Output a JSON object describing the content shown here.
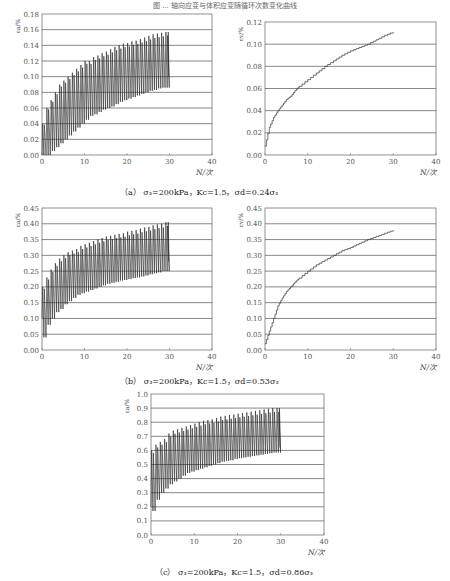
{
  "page": {
    "title": "图 ... 轴向应变与体积应变随循环次数变化曲线"
  },
  "captions": {
    "a": "（a） σ₃=200kPa，Kc=1.5，σd=0.24σ₃",
    "b": "（b） σ₃=200kPa，Kc=1.5，σd=0.53σ₃",
    "c": "（c） σ₃=200kPa，Kc=1.5，σd=0.86σ₃"
  },
  "chart_data": [
    {
      "id": "a-left",
      "type": "line",
      "title": "",
      "xlabel": "N/次",
      "ylabel": "εa/%",
      "xlim": [
        0,
        40
      ],
      "ylim": [
        0,
        0.18
      ],
      "xticks": [
        "0",
        "10",
        "20",
        "30",
        "40"
      ],
      "yticks": [
        "0.00",
        "0.02",
        "0.04",
        "0.06",
        "0.08",
        "0.10",
        "0.12",
        "0.14",
        "0.16",
        "0.18"
      ],
      "grid": "horizontal",
      "description": "cyclic axial strain oscillating between envelope min and max",
      "x": [
        0,
        1,
        2,
        3,
        4,
        5,
        6,
        7,
        8,
        9,
        10,
        11,
        12,
        13,
        14,
        15,
        16,
        17,
        18,
        19,
        20,
        21,
        22,
        23,
        24,
        25,
        26,
        27,
        28,
        29
      ],
      "series": [
        {
          "name": "peak",
          "values": [
            0.04,
            0.06,
            0.07,
            0.08,
            0.09,
            0.095,
            0.1,
            0.105,
            0.11,
            0.115,
            0.12,
            0.12,
            0.125,
            0.127,
            0.13,
            0.132,
            0.135,
            0.138,
            0.14,
            0.142,
            0.143,
            0.145,
            0.146,
            0.148,
            0.15,
            0.152,
            0.154,
            0.155,
            0.156,
            0.157
          ]
        },
        {
          "name": "trough",
          "values": [
            0.0,
            0.0,
            0.0,
            0.005,
            0.01,
            0.015,
            0.02,
            0.025,
            0.03,
            0.035,
            0.04,
            0.045,
            0.05,
            0.052,
            0.055,
            0.058,
            0.06,
            0.062,
            0.065,
            0.068,
            0.07,
            0.072,
            0.074,
            0.076,
            0.078,
            0.08,
            0.082,
            0.083,
            0.085,
            0.086
          ]
        }
      ],
      "end_value": 0.1
    },
    {
      "id": "a-right",
      "type": "line",
      "title": "",
      "xlabel": "N/次",
      "ylabel": "εv/%",
      "xlim": [
        0,
        40
      ],
      "ylim": [
        0,
        0.12
      ],
      "xticks": [
        "0",
        "10",
        "20",
        "30",
        "40"
      ],
      "yticks": [
        "0.00",
        "0.02",
        "0.04",
        "0.06",
        "0.08",
        "0.10",
        "0.12"
      ],
      "grid": "horizontal",
      "x": [
        0,
        1,
        2,
        3,
        4,
        5,
        6,
        7,
        8,
        10,
        12,
        14,
        16,
        18,
        20,
        22,
        24,
        26,
        28,
        30
      ],
      "values": [
        0.008,
        0.025,
        0.034,
        0.04,
        0.045,
        0.05,
        0.053,
        0.058,
        0.062,
        0.068,
        0.074,
        0.08,
        0.085,
        0.09,
        0.094,
        0.097,
        0.1,
        0.104,
        0.108,
        0.111
      ]
    },
    {
      "id": "b-left",
      "type": "line",
      "title": "",
      "xlabel": "N/次",
      "ylabel": "εa/%",
      "xlim": [
        0,
        40
      ],
      "ylim": [
        0,
        0.45
      ],
      "xticks": [
        "0",
        "10",
        "20",
        "30",
        "40"
      ],
      "yticks": [
        "0.00",
        "0.05",
        "0.10",
        "0.15",
        "0.20",
        "0.25",
        "0.30",
        "0.35",
        "0.40",
        "0.45"
      ],
      "grid": "horizontal",
      "description": "cyclic axial strain oscillating between envelope min and max",
      "x": [
        0,
        1,
        2,
        3,
        4,
        5,
        6,
        7,
        8,
        9,
        10,
        11,
        12,
        13,
        14,
        15,
        16,
        17,
        18,
        19,
        20,
        21,
        22,
        23,
        24,
        25,
        26,
        27,
        28,
        29
      ],
      "series": [
        {
          "name": "peak",
          "values": [
            0.2,
            0.23,
            0.255,
            0.275,
            0.29,
            0.3,
            0.31,
            0.315,
            0.32,
            0.33,
            0.335,
            0.34,
            0.345,
            0.35,
            0.355,
            0.36,
            0.362,
            0.365,
            0.368,
            0.37,
            0.375,
            0.378,
            0.38,
            0.385,
            0.388,
            0.39,
            0.395,
            0.398,
            0.4,
            0.405
          ]
        },
        {
          "name": "trough",
          "values": [
            0.1,
            0.04,
            0.08,
            0.1,
            0.12,
            0.13,
            0.145,
            0.155,
            0.165,
            0.175,
            0.18,
            0.185,
            0.19,
            0.195,
            0.2,
            0.205,
            0.21,
            0.213,
            0.216,
            0.22,
            0.222,
            0.225,
            0.228,
            0.23,
            0.233,
            0.236,
            0.24,
            0.243,
            0.246,
            0.25
          ]
        }
      ],
      "end_value": 0.28
    },
    {
      "id": "b-right",
      "type": "line",
      "title": "",
      "xlabel": "N/次",
      "ylabel": "εv/%",
      "xlim": [
        0,
        40
      ],
      "ylim": [
        0,
        0.45
      ],
      "xticks": [
        "0",
        "10",
        "20",
        "30",
        "40"
      ],
      "yticks": [
        "0.00",
        "0.05",
        "0.10",
        "0.15",
        "0.20",
        "0.25",
        "0.30",
        "0.35",
        "0.40",
        "0.45"
      ],
      "grid": "horizontal",
      "x": [
        0,
        1,
        2,
        3,
        4,
        5,
        6,
        7,
        8,
        10,
        12,
        14,
        16,
        18,
        20,
        22,
        24,
        26,
        28,
        30
      ],
      "values": [
        0.02,
        0.06,
        0.1,
        0.14,
        0.165,
        0.185,
        0.2,
        0.215,
        0.228,
        0.25,
        0.27,
        0.285,
        0.3,
        0.315,
        0.325,
        0.338,
        0.35,
        0.36,
        0.37,
        0.38
      ]
    },
    {
      "id": "c",
      "type": "line",
      "title": "",
      "xlabel": "N/次",
      "ylabel": "εa/%",
      "xlim": [
        0,
        40
      ],
      "ylim": [
        0,
        1.0
      ],
      "xticks": [
        "0",
        "10",
        "20",
        "30",
        "40"
      ],
      "yticks": [
        "0.0",
        "0.1",
        "0.2",
        "0.3",
        "0.4",
        "0.5",
        "0.6",
        "0.7",
        "0.8",
        "0.9",
        "1.0"
      ],
      "grid": "horizontal",
      "description": "cyclic axial strain oscillating between envelope min and max",
      "x": [
        0,
        1,
        2,
        3,
        4,
        5,
        6,
        7,
        8,
        9,
        10,
        11,
        12,
        13,
        14,
        15,
        16,
        17,
        18,
        19,
        20,
        21,
        22,
        23,
        24,
        25,
        26,
        27,
        28,
        29
      ],
      "series": [
        {
          "name": "peak",
          "values": [
            0.6,
            0.64,
            0.66,
            0.68,
            0.72,
            0.74,
            0.75,
            0.76,
            0.77,
            0.78,
            0.79,
            0.8,
            0.81,
            0.815,
            0.82,
            0.83,
            0.84,
            0.845,
            0.85,
            0.855,
            0.86,
            0.865,
            0.87,
            0.875,
            0.88,
            0.885,
            0.89,
            0.895,
            0.9,
            0.9
          ]
        },
        {
          "name": "trough",
          "values": [
            0.2,
            0.17,
            0.25,
            0.3,
            0.33,
            0.36,
            0.38,
            0.4,
            0.42,
            0.44,
            0.45,
            0.46,
            0.47,
            0.48,
            0.49,
            0.5,
            0.51,
            0.52,
            0.525,
            0.53,
            0.54,
            0.545,
            0.55,
            0.555,
            0.56,
            0.565,
            0.57,
            0.575,
            0.58,
            0.585
          ]
        }
      ],
      "end_value": 0.62
    }
  ]
}
